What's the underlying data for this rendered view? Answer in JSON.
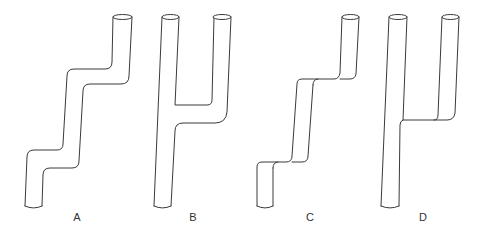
{
  "figure": {
    "type": "pipe-shape-diagram",
    "colors": {
      "stroke": "#3a3a3a",
      "background": "#ffffff",
      "label": "#333333"
    },
    "panels": [
      {
        "id": "A",
        "label": "A",
        "description": "single pipe with two step-offsets (zigzag)"
      },
      {
        "id": "B",
        "label": "B",
        "description": "branching pipe, two tops joined into one base, rounded junction"
      },
      {
        "id": "C",
        "label": "C",
        "description": "single pipe with two sharp step-offsets"
      },
      {
        "id": "D",
        "label": "D",
        "description": "branching pipe, two tops joined into one base, sharp junction"
      }
    ]
  }
}
